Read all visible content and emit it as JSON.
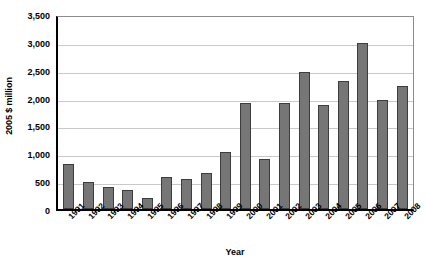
{
  "chart_data": {
    "type": "bar",
    "title": "",
    "xlabel": "Year",
    "ylabel": "2005 $ million",
    "categories": [
      "1991",
      "1992",
      "1993",
      "1994",
      "1995",
      "1996",
      "1997",
      "1998",
      "1999",
      "2000",
      "2001",
      "2002",
      "2003",
      "2004",
      "2005",
      "2006",
      "2007",
      "2008"
    ],
    "values": [
      800,
      490,
      400,
      340,
      190,
      580,
      530,
      650,
      1020,
      1900,
      900,
      1900,
      2460,
      1860,
      2300,
      2980,
      1960,
      2200
    ],
    "ylim": [
      0,
      3500
    ],
    "y_ticks": [
      0,
      500,
      1000,
      1500,
      2000,
      2500,
      3000,
      3500
    ],
    "y_tick_labels": [
      "0",
      "500",
      "1,000",
      "1,500",
      "2,000",
      "2,500",
      "3,000",
      "3,500"
    ],
    "grid": true,
    "legend": "none",
    "bar_color": "#767676",
    "bar_border_color": "#3d3d3d",
    "gridline_color": "#c9c9c9",
    "axis_color": "#000000",
    "background_color": "#ffffff"
  }
}
